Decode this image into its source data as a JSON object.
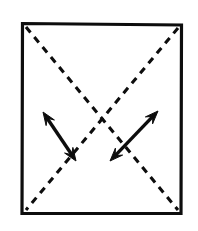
{
  "figure": {
    "canvas": {
      "width": 198,
      "height": 231,
      "background": "#ffffff"
    },
    "ink_color": "#0d0d0d",
    "shapes": {
      "rectangle": {
        "label": "outer-square",
        "x": 22.5,
        "y": 23.5,
        "width": 159,
        "height": 190,
        "stroke_width": 3.2,
        "fill": "none",
        "style": "solid",
        "corners": {
          "top_left": [
            22.5,
            23.5
          ],
          "top_right": [
            181.5,
            25.0
          ],
          "bottom_right": [
            181.0,
            213.5
          ],
          "bottom_left": [
            22.0,
            213.5
          ]
        }
      },
      "diagonals": [
        {
          "label": "diagonal-tl-br",
          "from": [
            26,
            27
          ],
          "to": [
            178,
            210
          ],
          "style": "dashed",
          "dash_on": 7,
          "dash_off": 6,
          "stroke_width": 3.1
        },
        {
          "label": "diagonal-tr-bl",
          "from": [
            178,
            28
          ],
          "to": [
            26,
            210
          ],
          "style": "dashed",
          "dash_on": 7,
          "dash_off": 6,
          "stroke_width": 3.1
        }
      ],
      "crossing_point": [
        101,
        108
      ],
      "arrows": [
        {
          "label": "left-double-arrow",
          "tail": [
            76,
            161
          ],
          "head": [
            43,
            112
          ],
          "double_headed": true,
          "style": "solid",
          "stroke_width": 3.4,
          "head_length": 13,
          "head_width": 10,
          "direction": "up-left / down-right"
        },
        {
          "label": "right-double-arrow",
          "tail": [
            110,
            161
          ],
          "head": [
            158,
            111
          ],
          "double_headed": true,
          "style": "solid",
          "stroke_width": 3.4,
          "head_length": 13,
          "head_width": 10,
          "direction": "up-right / down-left"
        }
      ]
    }
  }
}
